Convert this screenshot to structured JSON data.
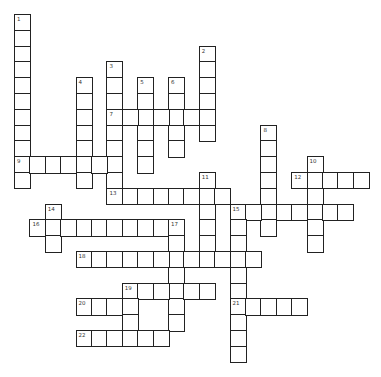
{
  "puzzle": {
    "type": "crossword",
    "layout": {
      "origin_x": 14,
      "origin_y": 14,
      "cell_w": 15.4,
      "cell_h": 15.8
    },
    "colors": {
      "border": "#222222",
      "cell": "#ffffff",
      "background": "#ffffff"
    },
    "words": [
      {
        "number": "1",
        "dir": "down",
        "row": 0,
        "col": 0,
        "length": 11
      },
      {
        "number": "2",
        "dir": "down",
        "row": 2,
        "col": 12,
        "length": 6
      },
      {
        "number": "3",
        "dir": "down",
        "row": 3,
        "col": 6,
        "length": 9
      },
      {
        "number": "4",
        "dir": "down",
        "row": 4,
        "col": 4,
        "length": 7
      },
      {
        "number": "5",
        "dir": "down",
        "row": 4,
        "col": 8,
        "length": 6
      },
      {
        "number": "6",
        "dir": "down",
        "row": 4,
        "col": 10,
        "length": 5
      },
      {
        "number": "7",
        "dir": "across",
        "row": 6,
        "col": 6,
        "length": 7
      },
      {
        "number": "8",
        "dir": "down",
        "row": 7,
        "col": 16,
        "length": 7
      },
      {
        "number": "9",
        "dir": "across",
        "row": 9,
        "col": 0,
        "length": 7
      },
      {
        "number": "10",
        "dir": "down",
        "row": 9,
        "col": 19,
        "length": 6
      },
      {
        "number": "11",
        "dir": "down",
        "row": 10,
        "col": 12,
        "length": 6
      },
      {
        "number": "12",
        "dir": "across",
        "row": 10,
        "col": 18,
        "length": 5
      },
      {
        "number": "13",
        "dir": "across",
        "row": 11,
        "col": 6,
        "length": 8
      },
      {
        "number": "14",
        "dir": "down",
        "row": 12,
        "col": 2,
        "length": 3
      },
      {
        "number": "15",
        "dir": "across",
        "row": 12,
        "col": 14,
        "length": 8
      },
      {
        "number": "15",
        "dir": "down",
        "row": 12,
        "col": 14,
        "length": 10
      },
      {
        "number": "16",
        "dir": "across",
        "row": 13,
        "col": 1,
        "length": 10
      },
      {
        "number": "17",
        "dir": "down",
        "row": 13,
        "col": 10,
        "length": 7
      },
      {
        "number": "18",
        "dir": "across",
        "row": 15,
        "col": 4,
        "length": 12
      },
      {
        "number": "19",
        "dir": "across",
        "row": 17,
        "col": 7,
        "length": 6
      },
      {
        "number": "19",
        "dir": "down",
        "row": 17,
        "col": 7,
        "length": 4
      },
      {
        "number": "20",
        "dir": "across",
        "row": 18,
        "col": 4,
        "length": 4
      },
      {
        "number": "21",
        "dir": "across",
        "row": 18,
        "col": 14,
        "length": 5
      },
      {
        "number": "22",
        "dir": "across",
        "row": 20,
        "col": 4,
        "length": 6
      }
    ]
  }
}
